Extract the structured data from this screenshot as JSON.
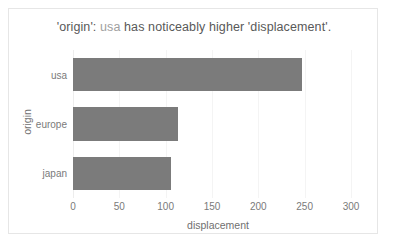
{
  "chart_data": {
    "type": "bar",
    "orientation": "horizontal",
    "title": "'origin': usa has noticeably higher 'displacement'.",
    "title_parts": {
      "prefix": "'origin': ",
      "highlight": "usa",
      "suffix": " has noticeably higher 'displacement'."
    },
    "categories": [
      "usa",
      "europe",
      "japan"
    ],
    "values": [
      247,
      113,
      106
    ],
    "xlabel": "displacement",
    "ylabel": "origin",
    "xlim": [
      0,
      300
    ],
    "xticks": [
      0,
      50,
      100,
      150,
      200,
      250,
      300
    ],
    "xtick_labels": [
      "0",
      "50",
      "100",
      "150",
      "200",
      "250",
      "300"
    ],
    "grid": "vertical-faint",
    "legend": "none",
    "bar_color": "#7b7b7b",
    "title_color": "#595959",
    "highlight_color": "#a0a0a0",
    "axis_text_color": "#7a7a7a",
    "background_color": "#ffffff",
    "border_color": "#e6e6e6"
  }
}
